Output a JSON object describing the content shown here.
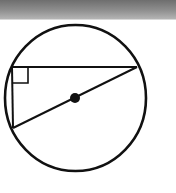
{
  "diagram": {
    "colors": {
      "stroke": "#111111",
      "background": "#ffffff",
      "header_bar_top": "#6e6e6e",
      "header_bar_bottom": "#b4b4b4"
    },
    "circle": {
      "cx": 75.5,
      "cy": 98,
      "rx": 70.5,
      "ry": 73
    },
    "center_dot": {
      "cx": 75,
      "cy": 98,
      "r": 5
    },
    "triangle": {
      "vertex_right_angle": {
        "x": 12,
        "y": 67
      },
      "vertex_right": {
        "x": 137,
        "y": 67
      },
      "vertex_bottom": {
        "x": 13,
        "y": 128
      }
    },
    "right_angle_marker": {
      "x": 12,
      "y": 67,
      "size": 16
    }
  }
}
